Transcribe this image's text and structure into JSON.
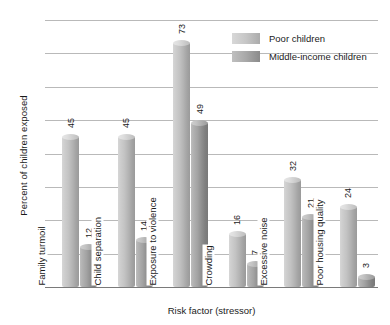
{
  "chart_data": {
    "type": "bar",
    "title": "",
    "xlabel": "Risk factor (stressor)",
    "ylabel": "Percent of children exposed",
    "ylim": [
      0,
      80
    ],
    "yticks": [
      0,
      10,
      20,
      30,
      40,
      50,
      60,
      70,
      80
    ],
    "grid": true,
    "legend_position": "top-right",
    "categories": [
      "Family turmoil",
      "Child separation",
      "Exposure to violence",
      "Crowding",
      "Excessive noise",
      "Poor housing quality"
    ],
    "series": [
      {
        "name": "Poor children",
        "color": "#c6c6c6",
        "values": [
          45,
          45,
          73,
          16,
          32,
          24
        ]
      },
      {
        "name": "Middle-income children",
        "color": "#a8a8a8",
        "values": [
          12,
          14,
          49,
          7,
          21,
          3
        ]
      }
    ]
  }
}
